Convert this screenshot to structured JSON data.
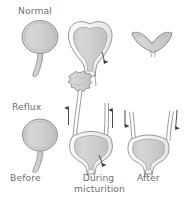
{
  "figure": {
    "background_color": "#ffffff",
    "outline_color": "#8a8a8a",
    "fill_color": "#d2d2d2",
    "fill_color_dark": "#bdbdbd",
    "text_color": "#6f6f6f",
    "arrow_color": "#3f3f3f"
  },
  "row_labels": [
    {
      "id": "normal",
      "text": "Normal"
    },
    {
      "id": "reflux",
      "text": "Reflux"
    }
  ],
  "column_labels": [
    {
      "id": "before",
      "text": "Before"
    },
    {
      "id": "during",
      "line1": "During",
      "line2": "micturition"
    },
    {
      "id": "after",
      "text": "After"
    }
  ],
  "panels": [
    {
      "id": "normal-before",
      "row": "normal",
      "column": "before",
      "organ": "bladder",
      "state": "full-round-bladder-with-urethra",
      "arrows": []
    },
    {
      "id": "normal-during",
      "row": "normal",
      "column": "during",
      "organ": "bladder",
      "state": "contracting-bladder-heart-shape-emptying",
      "arrows": [
        {
          "name": "urethra-outflow-arrow",
          "direction": "down"
        }
      ]
    },
    {
      "id": "normal-after",
      "row": "normal",
      "column": "after",
      "organ": "bladder",
      "state": "collapsed-empty-bladder",
      "arrows": []
    },
    {
      "id": "reflux-before",
      "row": "reflux",
      "column": "before",
      "organ": "bladder",
      "state": "full-round-bladder-with-urethra",
      "arrows": []
    },
    {
      "id": "reflux-during",
      "row": "reflux",
      "column": "during",
      "organ": "kidney-ureters-bladder",
      "state": "urine-refluxing-up-ureters-to-dilated-kidney",
      "arrows": [
        {
          "name": "left-ureter-reflux-arrow",
          "direction": "up"
        },
        {
          "name": "right-ureter-reflux-arrow",
          "direction": "up"
        },
        {
          "name": "urethra-outflow-arrow",
          "direction": "down"
        }
      ]
    },
    {
      "id": "reflux-after",
      "row": "reflux",
      "column": "after",
      "organ": "ureters-bladder",
      "state": "refluxed-urine-returning-down-into-bladder",
      "arrows": [
        {
          "name": "left-ureter-return-arrow",
          "direction": "down"
        },
        {
          "name": "right-ureter-return-arrow",
          "direction": "down"
        }
      ]
    }
  ]
}
